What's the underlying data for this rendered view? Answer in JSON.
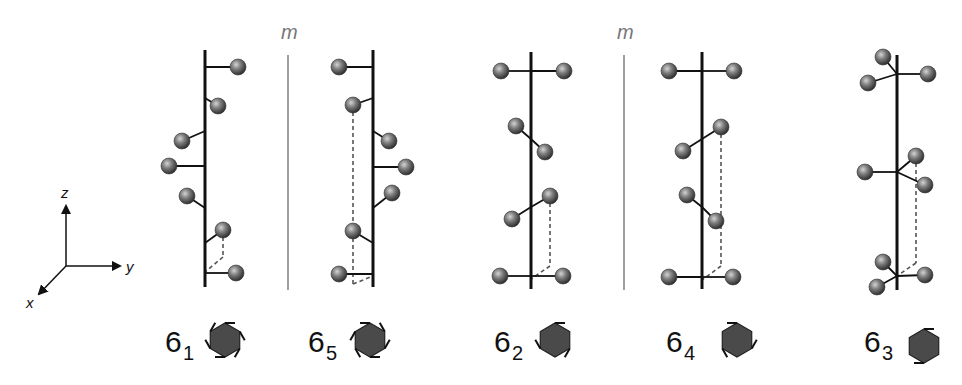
{
  "figure": {
    "colors": {
      "axis": "#111111",
      "mirror": "#888888",
      "sphere_light": "#c8c8c8",
      "sphere_mid": "#7a7a7a",
      "sphere_dark": "#3a3a3a",
      "symbol_fill": "#4a4a4a"
    },
    "coordinate_axes": {
      "origin": [
        66,
        266
      ],
      "labels": {
        "x": "x",
        "y": "y",
        "z": "z"
      }
    },
    "mirrors": [
      {
        "label": "m",
        "x": 288,
        "y1": 55,
        "y2": 290
      },
      {
        "label": "m",
        "x": 624,
        "y1": 55,
        "y2": 290
      }
    ],
    "screw_axes": [
      {
        "id": "6_1",
        "base": "6",
        "subscript": "1",
        "axis_x": 205,
        "axis_y1": 50,
        "axis_y2": 287,
        "spheres": [
          {
            "x": 238,
            "y": 67,
            "ax": 205,
            "ay": 67
          },
          {
            "x": 218,
            "y": 106,
            "ax": 205,
            "ay": 98
          },
          {
            "x": 182,
            "y": 141,
            "ax": 205,
            "ay": 131
          },
          {
            "x": 169,
            "y": 166,
            "ax": 205,
            "ay": 166
          },
          {
            "x": 187,
            "y": 196,
            "ax": 205,
            "ay": 208
          },
          {
            "x": 223,
            "y": 230,
            "ax": 205,
            "ay": 243
          },
          {
            "x": 236,
            "y": 273,
            "ax": 205,
            "ay": 273
          }
        ],
        "dashed": [
          [
            223,
            230,
            223,
            257
          ],
          [
            223,
            257,
            205,
            272
          ]
        ],
        "symbol": {
          "x": 225,
          "y": 340,
          "label_x": 165,
          "label_y": 352
        }
      },
      {
        "id": "6_5",
        "base": "6",
        "subscript": "5",
        "axis_x": 373,
        "axis_y1": 50,
        "axis_y2": 287,
        "spheres": [
          {
            "x": 339,
            "y": 67,
            "ax": 373,
            "ay": 67
          },
          {
            "x": 353,
            "y": 105,
            "ax": 373,
            "ay": 98
          },
          {
            "x": 389,
            "y": 141,
            "ax": 373,
            "ay": 131
          },
          {
            "x": 406,
            "y": 167,
            "ax": 373,
            "ay": 167
          },
          {
            "x": 392,
            "y": 193,
            "ax": 373,
            "ay": 208
          },
          {
            "x": 353,
            "y": 231,
            "ax": 373,
            "ay": 243
          },
          {
            "x": 339,
            "y": 274,
            "ax": 373,
            "ay": 274
          }
        ],
        "dashed": [
          [
            353,
            105,
            353,
            284
          ],
          [
            353,
            284,
            373,
            276
          ]
        ],
        "symbol": {
          "x": 370,
          "y": 340,
          "label_x": 308,
          "label_y": 352
        }
      },
      {
        "id": "6_2",
        "base": "6",
        "subscript": "2",
        "axis_x": 531,
        "axis_y1": 52,
        "axis_y2": 289,
        "spheres": [
          {
            "x": 501,
            "y": 71,
            "ax": 531,
            "ay": 71
          },
          {
            "x": 564,
            "y": 71,
            "ax": 531,
            "ay": 71
          },
          {
            "x": 516,
            "y": 126,
            "ax": 531,
            "ay": 139
          },
          {
            "x": 545,
            "y": 152,
            "ax": 531,
            "ay": 139
          },
          {
            "x": 550,
            "y": 196,
            "ax": 531,
            "ay": 207
          },
          {
            "x": 512,
            "y": 219,
            "ax": 531,
            "ay": 207
          },
          {
            "x": 500,
            "y": 276,
            "ax": 531,
            "ay": 276
          },
          {
            "x": 563,
            "y": 276,
            "ax": 531,
            "ay": 276
          }
        ],
        "dashed": [
          [
            550,
            196,
            550,
            266
          ],
          [
            550,
            266,
            531,
            279
          ]
        ],
        "symbol": {
          "x": 555,
          "y": 340,
          "label_x": 492,
          "label_y": 352
        }
      },
      {
        "id": "6_4",
        "base": "6",
        "subscript": "4",
        "axis_x": 702,
        "axis_y1": 52,
        "axis_y2": 289,
        "spheres": [
          {
            "x": 669,
            "y": 71,
            "ax": 702,
            "ay": 71
          },
          {
            "x": 734,
            "y": 71,
            "ax": 702,
            "ay": 71
          },
          {
            "x": 721,
            "y": 127,
            "ax": 702,
            "ay": 139
          },
          {
            "x": 683,
            "y": 151,
            "ax": 702,
            "ay": 139
          },
          {
            "x": 687,
            "y": 195,
            "ax": 702,
            "ay": 207
          },
          {
            "x": 716,
            "y": 221,
            "ax": 702,
            "ay": 207
          },
          {
            "x": 669,
            "y": 277,
            "ax": 702,
            "ay": 277
          },
          {
            "x": 733,
            "y": 277,
            "ax": 702,
            "ay": 277
          }
        ],
        "dashed": [
          [
            721,
            127,
            721,
            266
          ],
          [
            721,
            266,
            702,
            280
          ]
        ],
        "symbol": {
          "x": 737,
          "y": 340,
          "label_x": 666,
          "label_y": 352
        }
      },
      {
        "id": "6_3",
        "base": "6",
        "subscript": "3",
        "axis_x": 897,
        "axis_y1": 55,
        "axis_y2": 290,
        "spheres": [
          {
            "x": 883,
            "y": 57,
            "ax": 897,
            "ay": 74
          },
          {
            "x": 868,
            "y": 83,
            "ax": 897,
            "ay": 74
          },
          {
            "x": 928,
            "y": 74,
            "ax": 897,
            "ay": 74
          },
          {
            "x": 865,
            "y": 172,
            "ax": 897,
            "ay": 172
          },
          {
            "x": 916,
            "y": 156,
            "ax": 897,
            "ay": 172
          },
          {
            "x": 925,
            "y": 185,
            "ax": 897,
            "ay": 172
          },
          {
            "x": 883,
            "y": 262,
            "ax": 897,
            "ay": 276
          },
          {
            "x": 877,
            "y": 287,
            "ax": 897,
            "ay": 276
          },
          {
            "x": 925,
            "y": 275,
            "ax": 897,
            "ay": 276
          }
        ],
        "dashed": [
          [
            916,
            156,
            916,
            263
          ],
          [
            916,
            263,
            897,
            276
          ]
        ],
        "symbol": {
          "x": 924,
          "y": 346,
          "label_x": 866,
          "label_y": 352
        }
      }
    ]
  }
}
